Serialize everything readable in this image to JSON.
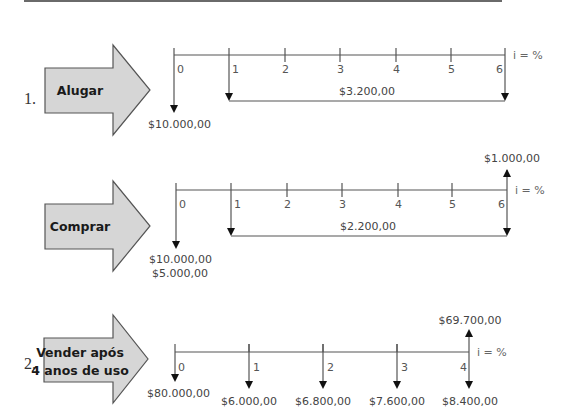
{
  "diagrams": [
    {
      "number": "1.",
      "option_label": "Alugar",
      "rate_label": "i = %",
      "periods": [
        "0",
        "1",
        "2",
        "3",
        "4",
        "5",
        "6"
      ],
      "cash_flows": [
        {
          "period": "0",
          "direction": "out",
          "label": "$10.000,00"
        },
        {
          "period": "1-6",
          "direction": "out",
          "series": true,
          "label": "$3.200,00"
        }
      ]
    },
    {
      "number": "",
      "option_label": "Comprar",
      "rate_label": "i = %",
      "periods": [
        "0",
        "1",
        "2",
        "3",
        "4",
        "5",
        "6"
      ],
      "cash_flows": [
        {
          "period": "0",
          "direction": "out",
          "label_line1": "$10.000,00",
          "label_line2": "$5.000,00"
        },
        {
          "period": "1-6",
          "direction": "out",
          "series": true,
          "label": "$2.200,00"
        },
        {
          "period": "6",
          "direction": "in",
          "label": "$1.000,00"
        }
      ]
    },
    {
      "number": "2.",
      "option_label_line1": "Vender após",
      "option_label_line2": "4 anos de uso",
      "rate_label": "i = %",
      "periods": [
        "0",
        "1",
        "2",
        "3",
        "4"
      ],
      "cash_flows": [
        {
          "period": "0",
          "direction": "out",
          "label": "$80.000,00"
        },
        {
          "period": "1",
          "direction": "out",
          "label": "$6.000,00"
        },
        {
          "period": "2",
          "direction": "out",
          "label": "$6.800,00"
        },
        {
          "period": "3",
          "direction": "out",
          "label": "$7.600,00"
        },
        {
          "period": "4",
          "direction": "out",
          "label": "$8.400,00"
        },
        {
          "period": "4",
          "direction": "in",
          "label": "$69.700,00"
        }
      ]
    }
  ]
}
